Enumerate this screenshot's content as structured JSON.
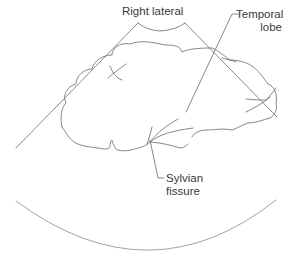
{
  "diagram": {
    "type": "ultrasound-sector-anatomy",
    "labels": {
      "view": "Right lateral",
      "temporal_lobe_line1": "Temporal",
      "temporal_lobe_line2": "lobe",
      "sylvian_line1": "Sylvian",
      "sylvian_line2": "fissure"
    },
    "colors": {
      "line": "#6a6a6a",
      "text": "#3a3a3a",
      "background": "#ffffff"
    }
  }
}
